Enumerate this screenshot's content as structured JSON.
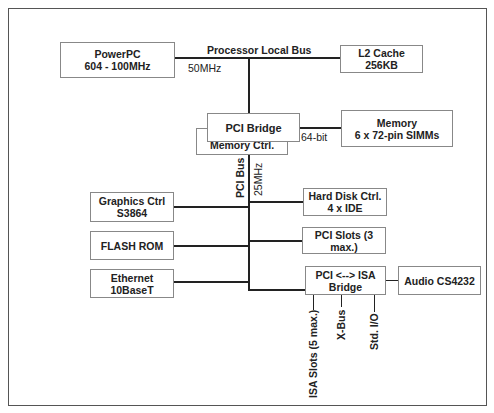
{
  "diagram": {
    "boxes": {
      "powerpc": {
        "line1": "PowerPC",
        "line2": "604 - 100MHz"
      },
      "l2cache": {
        "line1": "L2 Cache",
        "line2": "256KB"
      },
      "pci_bridge": {
        "line1": "PCI Bridge"
      },
      "memory_ctrl": {
        "line1": "Memory Ctrl."
      },
      "memory": {
        "line1": "Memory",
        "line2": "6 x 72-pin SIMMs"
      },
      "graphics": {
        "line1": "Graphics Ctrl",
        "line2": "S3864"
      },
      "flash": {
        "line1": "FLASH ROM"
      },
      "ethernet": {
        "line1": "Ethernet",
        "line2": "10BaseT"
      },
      "harddisk": {
        "line1": "Hard Disk Ctrl.",
        "line2": "4 x IDE"
      },
      "pci_slots": {
        "line1": "PCI Slots (3 max.)"
      },
      "isa_bridge": {
        "line1": "PCI <--> ISA",
        "line2": "Bridge"
      },
      "audio": {
        "line1": "Audio CS4232"
      }
    },
    "labels": {
      "processor_bus": "Processor Local Bus",
      "processor_bus_speed": "50MHz",
      "memory_width": "64-bit",
      "pci_bus": "PCI Bus",
      "pci_bus_speed": "25MHz",
      "isa_slots": "ISA Slots (5 max.)",
      "xbus": "X-Bus",
      "std_io": "Std. I/O"
    }
  }
}
